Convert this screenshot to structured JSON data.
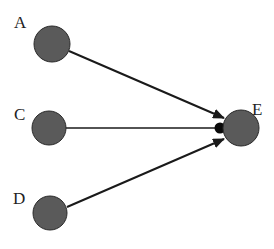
{
  "diagram": {
    "type": "directed-graph",
    "colors": {
      "node_fill": "#5a5a5a",
      "node_stroke": "#2a2a2a",
      "edge": "#1a1a1a",
      "junction": "#0a0a0a",
      "label": "#222222",
      "background": "#ffffff"
    },
    "nodes": [
      {
        "id": "A",
        "label": "A",
        "cx": 52,
        "cy": 44,
        "r": 18,
        "label_x": 14,
        "label_y": 28
      },
      {
        "id": "C",
        "label": "C",
        "cx": 49,
        "cy": 128,
        "r": 17,
        "label_x": 14,
        "label_y": 120
      },
      {
        "id": "D",
        "label": "D",
        "cx": 50,
        "cy": 213,
        "r": 17,
        "label_x": 13,
        "label_y": 204
      },
      {
        "id": "E",
        "label": "E",
        "cx": 241,
        "cy": 128,
        "r": 18,
        "label_x": 252,
        "label_y": 115
      }
    ],
    "edges": [
      {
        "from": "A",
        "to": "E",
        "arrow": "filled-triangle"
      },
      {
        "from": "C",
        "to": "E",
        "arrow": "filled-circle"
      },
      {
        "from": "D",
        "to": "E",
        "arrow": "filled-triangle"
      }
    ]
  }
}
